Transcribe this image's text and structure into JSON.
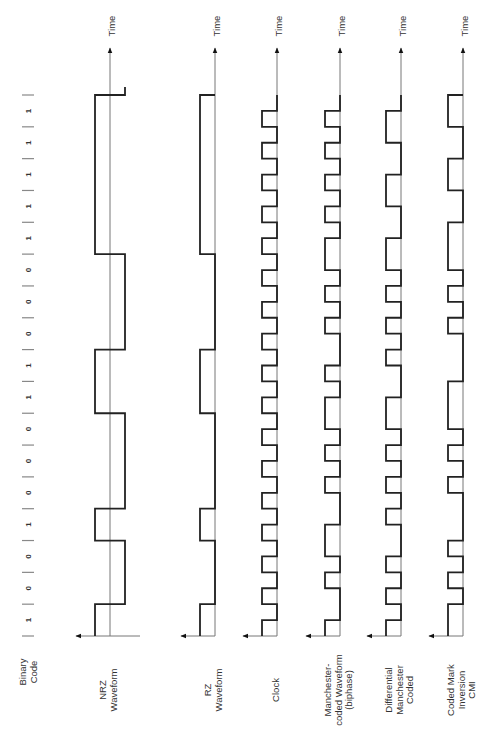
{
  "diagram": {
    "time_axis_label": "Time",
    "binary_code": {
      "label_lines": [
        "Binary",
        "Code"
      ],
      "bits": [
        1,
        0,
        0,
        1,
        0,
        0,
        0,
        1,
        1,
        0,
        0,
        0,
        1,
        1,
        1,
        1,
        1
      ]
    },
    "rows": [
      {
        "id": "nrz",
        "label_lines": [
          "NRZ",
          "Waveform"
        ],
        "style": "bipolar",
        "levels": [
          1,
          1,
          0,
          0,
          0,
          0,
          1,
          1,
          0,
          0,
          0,
          0,
          0,
          0,
          1,
          1,
          1,
          1,
          0,
          0,
          0,
          0,
          0,
          0,
          1,
          1,
          1,
          1,
          1,
          1,
          1,
          1,
          1,
          1
        ],
        "tail": "rise"
      },
      {
        "id": "rz",
        "label_lines": [
          "RZ",
          "Waveform"
        ],
        "style": "unipolar",
        "levels": [
          1,
          1,
          0,
          0,
          0,
          0,
          1,
          1,
          0,
          0,
          0,
          0,
          0,
          0,
          1,
          1,
          1,
          1,
          0,
          0,
          0,
          0,
          0,
          0,
          1,
          1,
          1,
          1,
          1,
          1,
          1,
          1,
          1,
          1
        ]
      },
      {
        "id": "clock",
        "label_lines": [
          "Clock"
        ],
        "style": "unipolar",
        "levels": [
          1,
          0,
          1,
          0,
          1,
          0,
          1,
          0,
          1,
          0,
          1,
          0,
          1,
          0,
          1,
          0,
          1,
          0,
          1,
          0,
          1,
          0,
          1,
          0,
          1,
          0,
          1,
          0,
          1,
          0,
          1,
          0,
          1,
          0
        ]
      },
      {
        "id": "manchester",
        "label_lines": [
          "Manchester-",
          "coded Waveform",
          "(biphase)"
        ],
        "style": "unipolar",
        "levels": [
          1,
          0,
          0,
          1,
          0,
          1,
          1,
          0,
          0,
          1,
          0,
          1,
          0,
          1,
          1,
          0,
          1,
          0,
          0,
          1,
          0,
          1,
          0,
          1,
          1,
          0,
          1,
          0,
          1,
          0,
          1,
          0,
          1,
          0
        ]
      },
      {
        "id": "differential-manchester",
        "label_lines": [
          "Differential",
          "Manchester",
          "Coded"
        ],
        "style": "unipolar",
        "levels": [
          1,
          0,
          1,
          0,
          1,
          0,
          0,
          1,
          0,
          1,
          0,
          1,
          0,
          1,
          1,
          0,
          0,
          1,
          0,
          1,
          0,
          1,
          0,
          1,
          1,
          0,
          0,
          1,
          1,
          0,
          0,
          1,
          1,
          0
        ]
      },
      {
        "id": "cmi",
        "label_lines": [
          "Coded Mark",
          "Inversion",
          "CMI"
        ],
        "style": "unipolar",
        "levels": [
          1,
          1,
          0,
          1,
          0,
          1,
          0,
          0,
          0,
          1,
          0,
          1,
          0,
          1,
          1,
          1,
          0,
          0,
          0,
          1,
          0,
          1,
          0,
          1,
          1,
          1,
          0,
          0,
          1,
          1,
          0,
          0,
          1,
          1
        ]
      }
    ]
  }
}
